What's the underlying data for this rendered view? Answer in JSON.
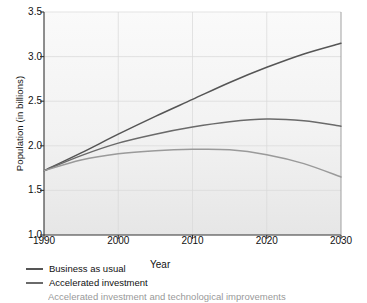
{
  "chart_data": {
    "type": "line",
    "title": "",
    "subtitle": "",
    "xlabel": "Year",
    "ylabel": "Population (in billions)",
    "xlim": [
      1990,
      2030
    ],
    "ylim": [
      1.0,
      3.5
    ],
    "xticks": [
      1990,
      2000,
      2010,
      2020,
      2030
    ],
    "xtick_labels": [
      "1990",
      "2000",
      "2010",
      "2020",
      "2030"
    ],
    "yticks": [
      1.0,
      1.5,
      2.0,
      2.5,
      3.0,
      3.5
    ],
    "ytick_labels": [
      "1.0",
      "1.5",
      "2.0",
      "2.5",
      "3.0",
      "3.5"
    ],
    "grid": true,
    "grid_color": "#d9d9d9",
    "plot_background": "#f0f0f0",
    "legend_position": "below-left",
    "x": [
      1990,
      1995,
      2000,
      2005,
      2010,
      2015,
      2020,
      2025,
      2030
    ],
    "series": [
      {
        "name": "Business as usual",
        "color": "#555555",
        "values": [
          1.72,
          1.92,
          2.13,
          2.33,
          2.52,
          2.71,
          2.88,
          3.03,
          3.15
        ]
      },
      {
        "name": "Accelerated investment",
        "color": "#6a6a6a",
        "values": [
          1.72,
          1.89,
          2.03,
          2.13,
          2.21,
          2.27,
          2.3,
          2.28,
          2.22
        ]
      },
      {
        "name": "Accelerated investment and technological improvements",
        "color": "#9a9a9a",
        "values": [
          1.72,
          1.84,
          1.91,
          1.945,
          1.96,
          1.955,
          1.9,
          1.8,
          1.65
        ]
      }
    ]
  },
  "legend": {
    "items": [
      {
        "label": "Business as usual",
        "color": "#555555"
      },
      {
        "label": "Accelerated investment",
        "color": "#6a6a6a"
      },
      {
        "label": "Accelerated investment and technological improvements",
        "color": "#9a9a9a"
      }
    ]
  }
}
